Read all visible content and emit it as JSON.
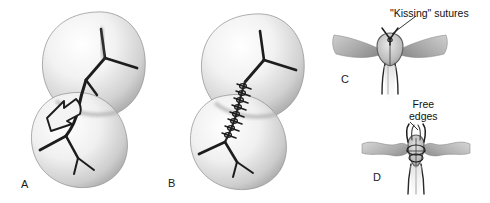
{
  "figure": {
    "background_color": "#ffffff",
    "ink_color": "#1a1a1a",
    "organ_fill_light": "#fdfdfd",
    "organ_fill_mid": "#d8d8d8",
    "organ_fill_dark": "#9a9a9a",
    "tissue_gray": "#a8a8a8"
  },
  "panels": [
    {
      "id": "A",
      "label": "A",
      "name": "panel-a-lacerated-kidney",
      "description": "Kidney with stellate laceration and arrow indicating defect"
    },
    {
      "id": "B",
      "label": "B",
      "name": "panel-b-sutured-kidney",
      "description": "Kidney with laceration closed by running suture line"
    },
    {
      "id": "C",
      "label": "C",
      "name": "panel-c-kissing-sutures",
      "description": "Cross section showing kissing sutures approximating edges"
    },
    {
      "id": "D",
      "label": "D",
      "name": "panel-d-free-edges",
      "description": "Cross section showing free edges of capsule"
    }
  ],
  "callouts": [
    {
      "id": "kissing-sutures",
      "text": "\"Kissing\" sutures",
      "panel": "C"
    },
    {
      "id": "free-edges",
      "text": "Free\nedges",
      "panel": "D"
    }
  ]
}
